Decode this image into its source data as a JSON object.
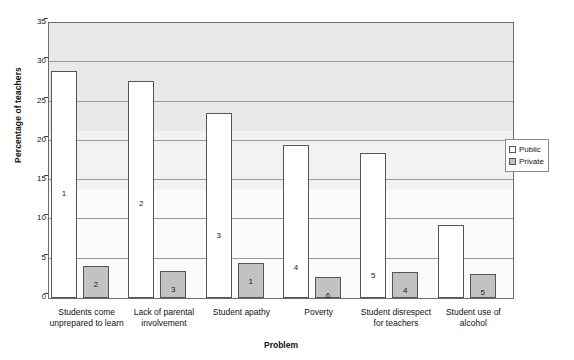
{
  "chart_data": {
    "type": "bar",
    "title": "",
    "xlabel": "Problem",
    "ylabel": "Percentage of teachers",
    "ylim": [
      0,
      35
    ],
    "yticks": [
      0,
      5,
      10,
      15,
      20,
      25,
      30,
      35
    ],
    "grid": true,
    "legend_position": "right",
    "categories": [
      "Students come unprepared to learn",
      "Lack of parental involvement",
      "Student apathy",
      "Poverty",
      "Student disrespect for teachers",
      "Student use of alcohol"
    ],
    "series": [
      {
        "name": "Public",
        "values": [
          28.9,
          27.6,
          23.6,
          19.5,
          18.5,
          9.3
        ],
        "point_labels": [
          "1",
          "2",
          "3",
          "4",
          "5",
          "10"
        ],
        "color": "#ffffff"
      },
      {
        "name": "Private",
        "values": [
          4.1,
          3.5,
          4.5,
          2.7,
          3.3,
          3.0
        ],
        "point_labels": [
          "2",
          "3",
          "1",
          "6",
          "4",
          "5"
        ],
        "color": "#c2c2c2"
      }
    ]
  },
  "axes": {
    "y_title": "Percentage of teachers",
    "x_title": "Problem",
    "y_tick_labels": [
      "0",
      "5",
      "10",
      "15",
      "20",
      "25",
      "30",
      "35"
    ]
  },
  "legend": {
    "items": [
      {
        "label": "Public",
        "swatch": "public-swatch"
      },
      {
        "label": "Private",
        "swatch": "private-swatch"
      }
    ]
  },
  "x_labels": [
    {
      "line1": "Students come",
      "line2": "unprepared to learn"
    },
    {
      "line1": "Lack of parental",
      "line2": "involvement"
    },
    {
      "line1": "Student apathy",
      "line2": ""
    },
    {
      "line1": "Poverty",
      "line2": ""
    },
    {
      "line1": "Student disrespect",
      "line2": "for teachers"
    },
    {
      "line1": "Student use of",
      "line2": "alcohol"
    }
  ],
  "colors": {
    "public_fill": "#ffffff",
    "private_fill": "#c2c2c2",
    "bar_border": "#555555",
    "plot_background": "#e9e9e9",
    "gridline": "#9a9a9a",
    "frame": "#6d6d6d"
  }
}
